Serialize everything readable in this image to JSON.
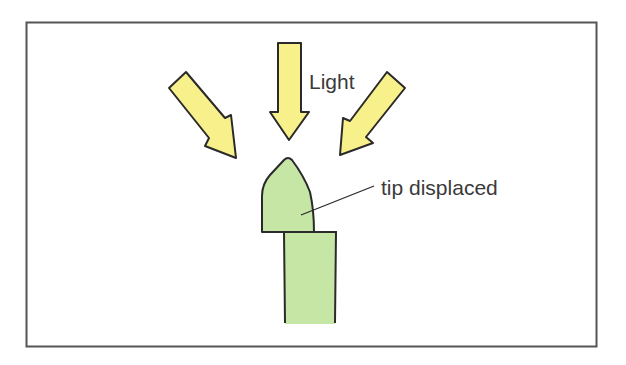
{
  "diagram": {
    "labels": {
      "light": "Light",
      "tip": "tip displaced"
    },
    "light_arrow_count": 3,
    "colors": {
      "arrow_fill": "#f8f08a",
      "plant_fill": "#c6e6a6",
      "outline": "#2a2a2a",
      "frame": "#555555",
      "text": "#3a3a3a"
    }
  }
}
